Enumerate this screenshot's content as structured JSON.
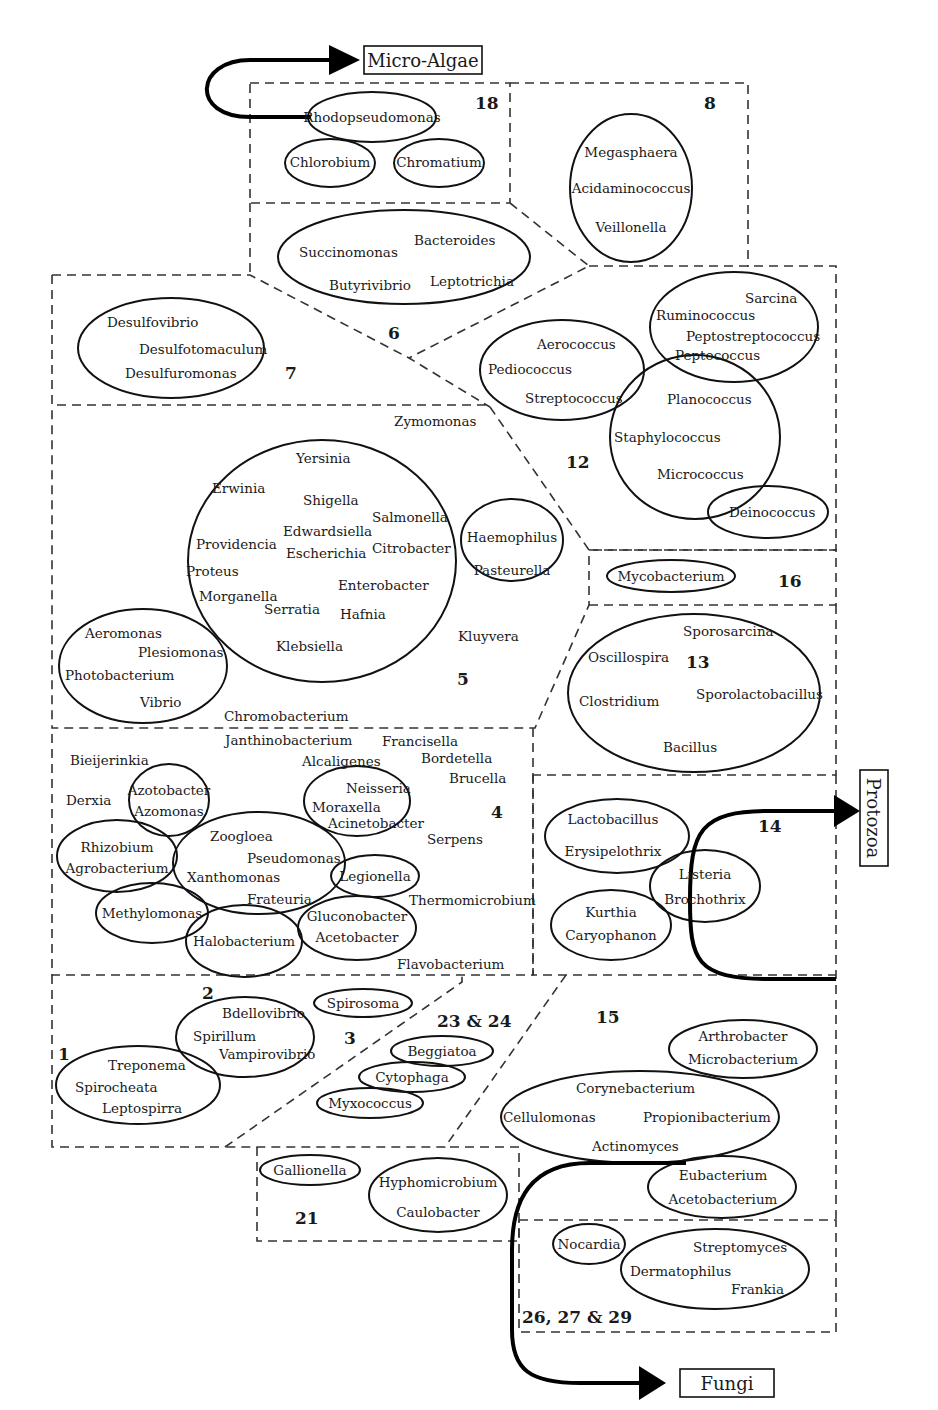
{
  "destinations": {
    "micro_algae": "Micro-Algae",
    "protozoa": "Protozoa",
    "fungi": "Fungi"
  },
  "groups": {
    "g1": "1",
    "g2": "2",
    "g3": "3",
    "g4": "4",
    "g5": "5",
    "g6": "6",
    "g7": "7",
    "g8": "8",
    "g12": "12",
    "g13": "13",
    "g14": "14",
    "g15": "15",
    "g16": "16",
    "g18": "18",
    "g21": "21",
    "g23_24": "23 & 24",
    "g26_27_29": "26, 27 & 29"
  },
  "genera": {
    "rhodopseudomonas": "Rhodopseudomonas",
    "chlorobium": "Chlorobium",
    "chromatium": "Chromatium",
    "megasphaera": "Megasphaera",
    "acidaminococcus": "Acidaminococcus",
    "veillonella": "Veillonella",
    "succinomonas": "Succinomonas",
    "bacteroides": "Bacteroides",
    "butyrivibrio": "Butyrivibrio",
    "leptotrichia": "Leptotrichia",
    "desulfovibrio": "Desulfovibrio",
    "desulfotomaculum": "Desulfotomaculum",
    "desulfuromonas": "Desulfuromonas",
    "sarcina": "Sarcina",
    "ruminococcus": "Ruminococcus",
    "peptostreptococcus": "Peptostreptococcus",
    "peptococcus": "Peptococcus",
    "aerococcus": "Aerococcus",
    "pediococcus": "Pediococcus",
    "streptococcus": "Streptococcus",
    "planococcus": "Planococcus",
    "staphylococcus": "Staphylococcus",
    "micrococcus": "Micrococcus",
    "deinococcus": "Deinococcus",
    "zymomonas": "Zymomonas",
    "yersinia": "Yersinia",
    "erwinia": "Erwinia",
    "shigella": "Shigella",
    "salmonella": "Salmonella",
    "edwardsiella": "Edwardsiella",
    "providencia": "Providencia",
    "escherichia": "Escherichia",
    "citrobacter": "Citrobacter",
    "proteus": "Proteus",
    "enterobacter": "Enterobacter",
    "morganella": "Morganella",
    "serratia": "Serratia",
    "hafnia": "Hafnia",
    "klebsiella": "Klebsiella",
    "haemophilus": "Haemophilus",
    "pasteurella": "Pasteurella",
    "kluyvera": "Kluyvera",
    "aeromonas": "Aeromonas",
    "plesiomonas": "Plesiomonas",
    "photobacterium": "Photobacterium",
    "vibrio": "Vibrio",
    "chromobacterium": "Chromobacterium",
    "mycobacterium": "Mycobacterium",
    "sporosarcina": "Sporosarcina",
    "oscillospira": "Oscillospira",
    "clostridium": "Clostridium",
    "sporolactobacillus": "Sporolactobacillus",
    "bacillus": "Bacillus",
    "janthinobacterium": "Janthinobacterium",
    "francisella": "Francisella",
    "bieijerinkia": "Bieijerinkia",
    "alcaligenes": "Alcaligenes",
    "bordetella": "Bordetella",
    "brucella": "Brucella",
    "azotobacter": "Azotobacter",
    "azomonas": "Azomonas",
    "derxia": "Derxia",
    "neisseria": "Neisseria",
    "moraxella": "Moraxella",
    "acinetobacter": "Acinetobacter",
    "zoogloea": "Zoogloea",
    "serpens": "Serpens",
    "rhizobium": "Rhizobium",
    "agrobacterium": "Agrobacterium",
    "pseudomonas": "Pseudomonas",
    "xanthomonas": "Xanthomonas",
    "legionella": "Legionella",
    "frateuria": "Frateuria",
    "thermomicrobium": "Thermomicrobium",
    "methylomonas": "Methylomonas",
    "gluconobacter": "Gluconobacter",
    "acetobacter": "Acetobacter",
    "halobacterium": "Halobacterium",
    "flavobacterium": "Flavobacterium",
    "lactobacillus": "Lactobacillus",
    "erysipelothrix": "Erysipelothrix",
    "listeria": "Listeria",
    "brochothrix": "Brochothrix",
    "kurthia": "Kurthia",
    "caryophanon": "Caryophanon",
    "bdellovibrio": "Bdellovibrio",
    "spirillum": "Spirillum",
    "vampirovibrio": "Vampirovibrio",
    "spirosoma": "Spirosoma",
    "treponema": "Treponema",
    "spirocheata": "Spirocheata",
    "leptospirra": "Leptospirra",
    "beggiatoa": "Beggiatoa",
    "cytophaga": "Cytophaga",
    "myxococcus": "Myxococcus",
    "arthrobacter": "Arthrobacter",
    "microbacterium": "Microbacterium",
    "corynebacterium": "Corynebacterium",
    "cellulomonas": "Cellulomonas",
    "propionibacterium": "Propionibacterium",
    "actinomyces": "Actinomyces",
    "eubacterium": "Eubacterium",
    "acetobacterium": "Acetobacterium",
    "gallionella": "Gallionella",
    "hyphomicrobium": "Hyphomicrobium",
    "caulobacter": "Caulobacter",
    "nocardia": "Nocardia",
    "streptomyces": "Streptomyces",
    "dermatophilus": "Dermatophilus",
    "frankia": "Frankia"
  }
}
